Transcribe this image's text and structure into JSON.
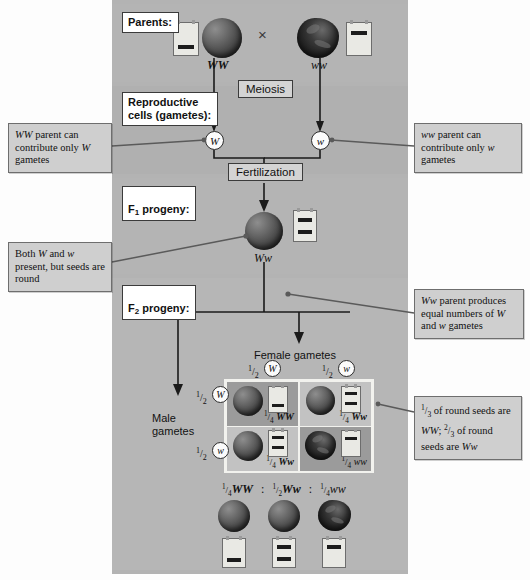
{
  "figure": {
    "colors": {
      "panel_bg": "#b3b3b3",
      "note_bg": "#cfcfcf",
      "proc_bg": "#d4d4d4",
      "label_bg": "#ffffff",
      "punnett_dark": "#9b9b9b",
      "punnett_light": "#c2c2c2",
      "ink": "#111111"
    }
  },
  "stages": {
    "parents": "Parents:",
    "gametes": "Reproductive\ncells (gametes):",
    "f1": "F1 progeny:",
    "f1_sub": "1",
    "f2": "F2 progeny:",
    "f2_sub": "2"
  },
  "processes": {
    "meiosis": "Meiosis",
    "fertilization": "Fertilization"
  },
  "parents": {
    "left_genotype": "WW",
    "cross_symbol": "×",
    "right_genotype": "ww",
    "left_seed_shape": "round",
    "right_seed_shape": "wrinkled",
    "left_gel_bands": 1,
    "right_gel_bands": 1
  },
  "gametes_row": {
    "left_allele": "W",
    "right_allele": "w"
  },
  "f1": {
    "genotype": "Ww",
    "seed_shape": "round",
    "gel_bands": 2
  },
  "f2": {
    "female_gametes_label": "Female gametes",
    "male_gametes_label": "Male\ngametes",
    "female_gametes": [
      {
        "fraction": "1/2",
        "allele": "W"
      },
      {
        "fraction": "1/2",
        "allele": "w"
      }
    ],
    "male_gametes": [
      {
        "fraction": "1/2",
        "allele": "W"
      },
      {
        "fraction": "1/2",
        "allele": "w"
      }
    ],
    "punnett": [
      {
        "fraction": "1/4",
        "genotype": "WW",
        "seed_shape": "round",
        "gel_bands": 1,
        "shade": "dark"
      },
      {
        "fraction": "1/4",
        "genotype": "Ww",
        "seed_shape": "round",
        "gel_bands": 2,
        "shade": "light"
      },
      {
        "fraction": "1/4",
        "genotype": "Ww",
        "seed_shape": "round",
        "gel_bands": 2,
        "shade": "light"
      },
      {
        "fraction": "1/4",
        "genotype": "ww",
        "seed_shape": "wrinkled",
        "gel_bands": 1,
        "shade": "dark"
      }
    ],
    "ratio": [
      {
        "fraction": "1/4",
        "genotype": "WW"
      },
      {
        "fraction": "1/2",
        "genotype": "Ww"
      },
      {
        "fraction": "1/4",
        "genotype": "ww"
      }
    ],
    "ratio_separator": ":",
    "summary_seeds": [
      {
        "genotype": "WW",
        "seed_shape": "round",
        "gel_bands": 1
      },
      {
        "genotype": "Ww",
        "seed_shape": "round",
        "gel_bands": 2
      },
      {
        "genotype": "ww",
        "seed_shape": "wrinkled",
        "gel_bands": 1
      }
    ]
  },
  "notes": {
    "left_top": "WW parent can contribute only W gametes",
    "right_top": "ww parent can contribute only w gametes",
    "left_mid": "Both W and w present, but seeds are round",
    "right_mid": "Ww parent produces equal numbers of W and w gametes",
    "right_bottom": "1/3 of round seeds are WW; 2/3 of round seeds are Ww"
  }
}
